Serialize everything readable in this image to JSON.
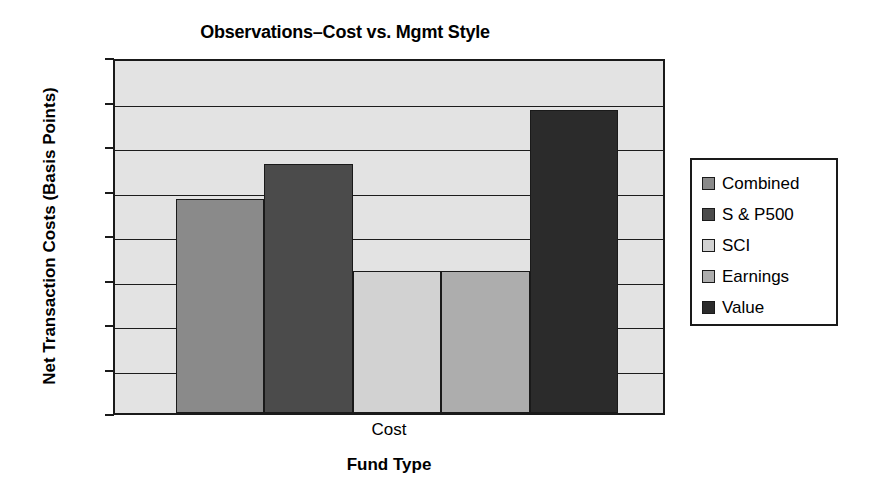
{
  "chart_data": {
    "type": "bar",
    "title": "Observations–Cost vs. Mgmt Style",
    "xlabel": "Fund Type",
    "ylabel": "Net Transaction Costs (Basis Points)",
    "categories": [
      "Cost"
    ],
    "series": [
      {
        "name": "Combined",
        "values": [
          48
        ],
        "color": "#8a8a8a"
      },
      {
        "name": "S & P500",
        "values": [
          56
        ],
        "color": "#4b4b4b"
      },
      {
        "name": "SCI",
        "values": [
          32
        ],
        "color": "#d2d2d2"
      },
      {
        "name": "Earnings",
        "values": [
          32
        ],
        "color": "#adadad"
      },
      {
        "name": "Value",
        "values": [
          68
        ],
        "color": "#2b2b2b"
      }
    ],
    "ylim": [
      0,
      80
    ],
    "yticks": [
      0,
      10,
      20,
      30,
      40,
      50,
      60,
      70,
      80
    ],
    "ytick_labels": [
      "0",
      "10",
      "20",
      "30",
      "40",
      "50",
      "60",
      "70",
      "80"
    ],
    "grid": true,
    "legend_position": "right",
    "plot_background": "#e3e3e3",
    "axis_color": "#1a1a1a"
  },
  "legend": {
    "items": [
      {
        "label": "Combined",
        "color": "#8a8a8a"
      },
      {
        "label": "S & P500",
        "color": "#4b4b4b"
      },
      {
        "label": "SCI",
        "color": "#d2d2d2"
      },
      {
        "label": "Earnings",
        "color": "#adadad"
      },
      {
        "label": "Value",
        "color": "#2b2b2b"
      }
    ]
  }
}
